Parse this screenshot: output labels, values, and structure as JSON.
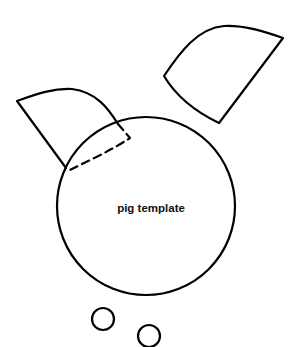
{
  "diagram": {
    "title": "pig template",
    "stroke_color": "#000000",
    "shapes": [
      {
        "id": "body",
        "type": "circle",
        "label": "pig template"
      },
      {
        "id": "left-ear",
        "type": "ear",
        "fold": "dashed"
      },
      {
        "id": "right-ear",
        "type": "ear"
      },
      {
        "id": "nostril-left",
        "type": "circle"
      },
      {
        "id": "nostril-right",
        "type": "circle"
      }
    ]
  }
}
